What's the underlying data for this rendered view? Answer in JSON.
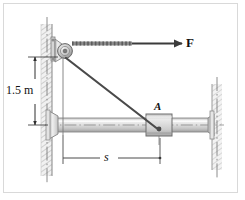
{
  "figure": {
    "background_color": "#ffffff",
    "frame_color": "#d9d9d9",
    "line_color": "#5a5a5a",
    "dark_line_color": "#3a3a3a",
    "hatch_color": "#b9b9b9",
    "metal_light": "#f0f0f0",
    "metal_mid": "#d2d2d2",
    "metal_dark": "#a8a8a8"
  },
  "labels": {
    "force": "F",
    "height": "1.5 m",
    "distance": "s",
    "point_a": "A"
  },
  "geometry": {
    "pulley_center": {
      "x": 65,
      "y": 51
    },
    "pulley_radius": 7,
    "collar_center": {
      "x": 159,
      "y": 127
    },
    "rod_y": 125,
    "rod_left_x": 50,
    "rod_right_x": 214,
    "left_wall_x": 41,
    "right_wall_x": 219,
    "force_arrow": {
      "x1": 78,
      "y1": 43,
      "x2": 180,
      "y2": 43
    },
    "cable": {
      "x1": 68,
      "y1": 55,
      "x2": 159,
      "y2": 130
    },
    "height_dim": {
      "x": 35,
      "y1": 57,
      "y2": 125
    },
    "distance_dim": {
      "y": 158,
      "x1": 63,
      "x2": 160
    }
  },
  "elements": {
    "left_wall_name": "left-wall-support",
    "right_wall_name": "right-wall-support",
    "pulley_name": "pulley-wheel",
    "rod_name": "horizontal-rod",
    "collar_name": "sliding-collar-a",
    "cable_name": "cable-line",
    "force_arrow_name": "force-arrow-f"
  }
}
